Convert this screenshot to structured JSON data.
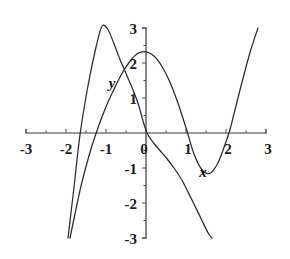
{
  "chart_data": {
    "type": "line",
    "title": "",
    "xlabel": "",
    "ylabel": "",
    "xlim": [
      -3,
      3
    ],
    "ylim": [
      -3,
      3
    ],
    "grid": false,
    "legend": "none",
    "x_ticks": [
      "-3",
      "-2",
      "-1",
      "0",
      "1",
      "2",
      "3"
    ],
    "x_tick_values": [
      -3,
      -2,
      -1,
      0,
      1,
      2,
      3
    ],
    "y_ticks": [
      "3",
      "2",
      "1",
      "-1",
      "-2",
      "-3"
    ],
    "y_tick_values": [
      3,
      2,
      1,
      -1,
      -2,
      -3
    ],
    "origin_label": "0",
    "series": [
      {
        "name": "x",
        "label": "x",
        "description": "cubic-like curve through origin, local minimum near (1.4, -1.1), rising steeply past x = 2.1",
        "x": [
          -1.9,
          -1.8,
          -1.7,
          -1.6,
          -1.4,
          -1.2,
          -1.0,
          -0.8,
          -0.6,
          -0.4,
          -0.2,
          0.0,
          0.2,
          0.4,
          0.6,
          0.8,
          1.0,
          1.2,
          1.4,
          1.6,
          1.8,
          2.0,
          2.1,
          2.2,
          2.4,
          2.6,
          2.8
        ],
        "y": [
          -3.0,
          -2.45,
          -1.9,
          -1.4,
          -0.55,
          0.15,
          0.75,
          1.25,
          1.7,
          2.05,
          2.28,
          2.32,
          2.2,
          1.9,
          1.45,
          0.85,
          0.15,
          -0.6,
          -1.05,
          -1.15,
          -0.85,
          -0.25,
          0.1,
          0.55,
          1.45,
          2.3,
          3.0
        ]
      },
      {
        "name": "y",
        "label": "y",
        "description": "steeply rising then falling curve, crosses x-axis near -1.65 and 1.15, passes near origin",
        "x": [
          -1.95,
          -1.8,
          -1.65,
          -1.45,
          -1.25,
          -1.1,
          -0.95,
          -0.8,
          -0.65,
          -0.5,
          -0.35,
          -0.2,
          -0.05,
          0.05,
          0.2,
          0.35,
          0.5,
          0.7,
          0.9,
          1.1,
          1.25,
          1.4,
          1.55,
          1.65
        ],
        "y": [
          -3.0,
          -1.55,
          -0.05,
          1.35,
          2.45,
          3.05,
          2.95,
          2.55,
          2.1,
          1.7,
          1.3,
          0.85,
          0.25,
          -0.05,
          -0.3,
          -0.5,
          -0.7,
          -1.0,
          -1.35,
          -1.8,
          -2.15,
          -2.5,
          -2.85,
          -3.0
        ]
      }
    ],
    "axis_color": "#3a3a3a",
    "curve_color": "#2b2b2b",
    "background_color": "#fefefe"
  }
}
